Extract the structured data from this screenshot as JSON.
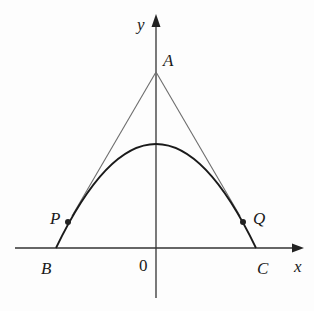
{
  "diagram": {
    "type": "parabola with tangent lines from point on y-axis",
    "axes": {
      "x_label": "x",
      "y_label": "y",
      "origin_label": "0"
    },
    "points": {
      "A": {
        "label": "A",
        "x": 156,
        "y": 72
      },
      "B": {
        "label": "B",
        "x": 56,
        "y": 248
      },
      "C": {
        "label": "C",
        "x": 256,
        "y": 248
      },
      "P": {
        "label": "P",
        "x": 68,
        "y": 222
      },
      "Q": {
        "label": "Q",
        "x": 243,
        "y": 222
      }
    },
    "parabola": {
      "vertex_x": 156,
      "vertex_y": 144,
      "axis_y": 248
    },
    "colors": {
      "curve": "#1a1a1a",
      "tangent": "#6e6e6e",
      "axis": "#333333"
    }
  }
}
